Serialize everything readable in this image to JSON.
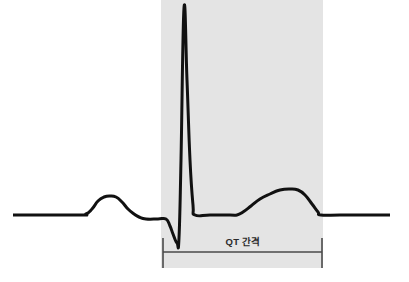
{
  "figure": {
    "canvas": {
      "width": 409,
      "height": 282,
      "background": "#ffffff"
    },
    "colors": {
      "trace": "#111111",
      "shaded_region": "#e4e4e4",
      "bracket": "#4a4a4a",
      "label_text": "#2b2b2b"
    }
  },
  "annotation": {
    "qt_label": "QT 간격",
    "bracket": {
      "left_x": 163,
      "right_x": 322,
      "line_y": 252,
      "tick_top_y": 238,
      "tick_bottom_y": 268
    }
  },
  "shaded_region": {
    "name": "qt-interval-highlight",
    "x": 161,
    "y": 0,
    "width": 162,
    "height": 268,
    "fill": "#e4e4e4"
  },
  "chart_data": {
    "type": "line",
    "xlabel": "",
    "ylabel": "",
    "grid": false,
    "legend": null,
    "annotations": [
      {
        "text": "QT 간격",
        "kind": "interval-bracket",
        "x_start": 163,
        "x_end": 322,
        "y": 252
      }
    ],
    "baseline_y": 215,
    "series": [
      {
        "name": "ecg-trace",
        "color": "#111111",
        "stroke_width": 3,
        "points": [
          [
            13,
            215
          ],
          [
            78,
            215
          ],
          [
            86,
            214
          ],
          [
            92,
            209
          ],
          [
            98,
            201
          ],
          [
            104,
            197
          ],
          [
            110,
            196
          ],
          [
            116,
            197
          ],
          [
            122,
            202
          ],
          [
            128,
            209
          ],
          [
            134,
            214
          ],
          [
            139,
            217
          ],
          [
            146,
            219
          ],
          [
            158,
            219
          ],
          [
            166,
            219
          ],
          [
            170,
            226
          ],
          [
            173,
            234
          ],
          [
            177,
            243
          ],
          [
            179,
            238
          ],
          [
            181,
            160
          ],
          [
            184,
            8
          ],
          [
            187,
            80
          ],
          [
            190,
            160
          ],
          [
            193,
            205
          ],
          [
            195,
            215
          ],
          [
            210,
            215
          ],
          [
            230,
            215
          ],
          [
            237,
            215
          ],
          [
            243,
            212
          ],
          [
            251,
            206
          ],
          [
            260,
            199
          ],
          [
            270,
            194
          ],
          [
            280,
            190
          ],
          [
            290,
            189
          ],
          [
            298,
            190
          ],
          [
            305,
            195
          ],
          [
            312,
            204
          ],
          [
            318,
            212
          ],
          [
            321,
            215
          ],
          [
            340,
            215
          ],
          [
            365,
            215
          ],
          [
            390,
            215
          ]
        ]
      }
    ],
    "features": [
      {
        "name": "P-wave",
        "peak_x": 110,
        "peak_y": 196
      },
      {
        "name": "Q-trough",
        "x": 177,
        "y": 243
      },
      {
        "name": "R-peak",
        "x": 184,
        "y": 8
      },
      {
        "name": "ST-segment",
        "x_start": 195,
        "x_end": 237,
        "y": 215
      },
      {
        "name": "T-wave",
        "peak_x": 290,
        "peak_y": 189
      }
    ]
  }
}
